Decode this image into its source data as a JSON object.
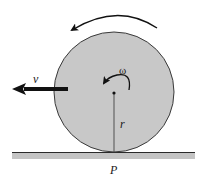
{
  "diagram": {
    "labels": {
      "velocity": "v",
      "angular_velocity": "ω",
      "radius": "r",
      "contact_point": "P"
    },
    "colors": {
      "disk_fill": "#c8c8c8",
      "disk_stroke": "#3a3a3a",
      "ground_fill": "#c4c4c4",
      "ground_edge": "#2a2a2a",
      "arrow": "#111111"
    }
  }
}
